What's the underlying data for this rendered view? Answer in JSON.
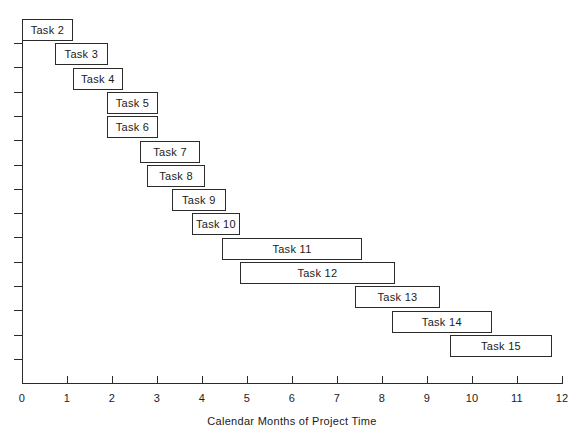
{
  "chart_data": {
    "type": "bar",
    "orientation": "horizontal",
    "subtype": "gantt",
    "title": "",
    "xlabel": "Calendar Months of Project Time",
    "ylabel": "",
    "xlim": [
      0,
      12
    ],
    "xticks": [
      0,
      1,
      2,
      3,
      4,
      5,
      6,
      7,
      8,
      9,
      10,
      11,
      12
    ],
    "xtick_labels": [
      "0",
      "1",
      "2",
      "3",
      "4",
      "5",
      "6",
      "7",
      "8",
      "9",
      "10",
      "11",
      "12"
    ],
    "grid": false,
    "legend": null,
    "y_tick_count": 14,
    "tasks": [
      {
        "label": "Task 2",
        "start": 0.0,
        "end": 1.13,
        "duration": 1.13
      },
      {
        "label": "Task 3",
        "start": 0.73,
        "end": 1.91,
        "duration": 1.18
      },
      {
        "label": "Task 4",
        "start": 1.13,
        "end": 2.24,
        "duration": 1.11
      },
      {
        "label": "Task 5",
        "start": 1.89,
        "end": 3.02,
        "duration": 1.13
      },
      {
        "label": "Task 6",
        "start": 1.89,
        "end": 3.02,
        "duration": 1.13
      },
      {
        "label": "Task 7",
        "start": 2.62,
        "end": 3.96,
        "duration": 1.34
      },
      {
        "label": "Task 8",
        "start": 2.78,
        "end": 4.07,
        "duration": 1.29
      },
      {
        "label": "Task 9",
        "start": 3.33,
        "end": 4.53,
        "duration": 1.2
      },
      {
        "label": "Task 10",
        "start": 3.78,
        "end": 4.84,
        "duration": 1.06
      },
      {
        "label": "Task 11",
        "start": 4.44,
        "end": 7.56,
        "duration": 3.12
      },
      {
        "label": "Task 12",
        "start": 4.84,
        "end": 8.29,
        "duration": 3.45
      },
      {
        "label": "Task 13",
        "start": 7.4,
        "end": 9.29,
        "duration": 1.89
      },
      {
        "label": "Task 14",
        "start": 8.22,
        "end": 10.44,
        "duration": 2.22
      },
      {
        "label": "Task 15",
        "start": 9.51,
        "end": 11.78,
        "duration": 2.27
      }
    ],
    "colors": {
      "bar_fill": "#ffffff",
      "bar_stroke": "#2b2b2b",
      "axis": "#2b2b2b",
      "text": "#1a1a1a",
      "background": "#ffffff"
    }
  },
  "geometry": {
    "origin_x": 22,
    "px_per_month": 45,
    "baseline_y": 383,
    "plot_top_y": 19,
    "row_height": 24.3,
    "bar_height": 22
  }
}
